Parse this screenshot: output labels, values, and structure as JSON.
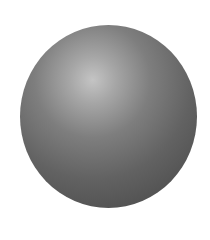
{
  "scene": {
    "object": "sphere",
    "shading": "radial-highlight-upper-left",
    "colors": {
      "background": "#ffffff",
      "highlight": "#c4c4c4",
      "midtone": "#7e7e7e",
      "shadow": "#474747"
    }
  }
}
